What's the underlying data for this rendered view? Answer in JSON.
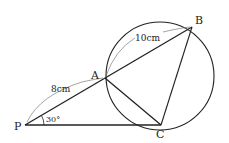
{
  "figure": {
    "type": "geometry-diagram",
    "points": {
      "P": {
        "label": "P",
        "x": 25,
        "y": 125
      },
      "A": {
        "label": "A",
        "x": 105,
        "y": 78
      },
      "B": {
        "label": "B",
        "x": 192,
        "y": 27
      },
      "C": {
        "label": "C",
        "x": 161,
        "y": 125
      }
    },
    "circle": {
      "cx": 160,
      "cy": 76,
      "r": 54
    },
    "segments": [
      {
        "from": "P",
        "to": "B"
      },
      {
        "from": "P",
        "to": "C"
      },
      {
        "from": "A",
        "to": "C"
      },
      {
        "from": "B",
        "to": "C"
      }
    ],
    "measurements": {
      "PA": "8cm",
      "AB": "10cm"
    },
    "angle": {
      "vertex": "P",
      "value": "30°"
    },
    "colors": {
      "stroke": "#222222",
      "background": "#ffffff"
    }
  }
}
